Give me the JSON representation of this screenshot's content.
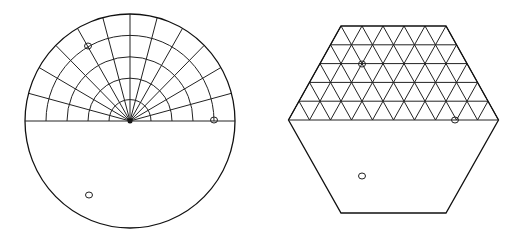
{
  "colors": {
    "background": "#ffffff",
    "line": "#222222"
  },
  "circle_diagram": {
    "center": [
      130,
      121
    ],
    "rx": 105,
    "ry": 107,
    "ring_radii": [
      21,
      42,
      63,
      84
    ],
    "spoke_step_deg": 15,
    "grid_half": "upper",
    "markers": [
      [
        88,
        46
      ],
      [
        214,
        120
      ],
      [
        89,
        195
      ]
    ]
  },
  "hexagon_diagram": {
    "top_y": 26,
    "mid_y": 120,
    "bottom_y": 213,
    "top_left_x": 341,
    "top_right_x": 446,
    "mid_left_x": 288.5,
    "mid_right_x": 498.5,
    "grid_rows": 5,
    "cell_width": 21,
    "grid_half": "upper",
    "markers": [
      [
        362,
        64
      ],
      [
        455,
        120
      ],
      [
        362,
        176
      ]
    ]
  }
}
